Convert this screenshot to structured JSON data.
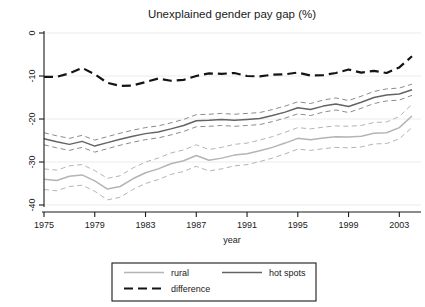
{
  "chart_data": {
    "type": "line",
    "title": "Unexplained gender pay gap (%)",
    "xlabel": "year",
    "ylabel": "",
    "xlim": [
      1975,
      2004
    ],
    "ylim": [
      -40,
      0
    ],
    "xticks": [
      1975,
      1979,
      1983,
      1987,
      1991,
      1995,
      1999,
      2003
    ],
    "yticks": [
      0,
      -10,
      -20,
      -30,
      -40
    ],
    "xtick_labels": [
      "1975",
      "1979",
      "1983",
      "1987",
      "1991",
      "1995",
      "1999",
      "2003"
    ],
    "ytick_labels": [
      "0",
      "-10",
      "-20",
      "-30",
      "-40"
    ],
    "grid": true,
    "legend_position": "bottom",
    "x": [
      1975,
      1976,
      1977,
      1978,
      1979,
      1980,
      1981,
      1982,
      1983,
      1984,
      1985,
      1986,
      1987,
      1988,
      1989,
      1990,
      1991,
      1992,
      1993,
      1994,
      1995,
      1996,
      1997,
      1998,
      1999,
      2000,
      2001,
      2002,
      2003,
      2004
    ],
    "series": [
      {
        "name": "rural",
        "color": "#b4b4b4",
        "style": "solid",
        "values": [
          -34.0,
          -34.3,
          -33.3,
          -33.0,
          -34.4,
          -36.3,
          -35.7,
          -33.9,
          -32.5,
          -31.6,
          -30.4,
          -29.7,
          -28.5,
          -29.6,
          -29.1,
          -28.4,
          -28.1,
          -27.4,
          -26.6,
          -25.6,
          -24.5,
          -24.8,
          -24.4,
          -24.1,
          -24.2,
          -24.0,
          -23.3,
          -23.2,
          -22.0,
          -19.3
        ]
      },
      {
        "name": "rural_ci_upper",
        "color": "#b4b4b4",
        "style": "dashed",
        "values": [
          -31.6,
          -31.9,
          -30.9,
          -30.6,
          -32.0,
          -33.8,
          -33.2,
          -31.4,
          -30.0,
          -29.1,
          -27.9,
          -27.2,
          -26.0,
          -27.1,
          -26.6,
          -25.9,
          -25.6,
          -24.9,
          -24.1,
          -23.1,
          -22.0,
          -22.3,
          -21.9,
          -21.6,
          -21.7,
          -21.5,
          -20.8,
          -20.7,
          -19.4,
          -16.6
        ]
      },
      {
        "name": "rural_ci_lower",
        "color": "#b4b4b4",
        "style": "dashed",
        "values": [
          -36.4,
          -36.7,
          -35.7,
          -35.4,
          -36.8,
          -38.8,
          -38.2,
          -36.4,
          -35.0,
          -34.1,
          -32.9,
          -32.2,
          -31.0,
          -32.1,
          -31.6,
          -30.9,
          -30.6,
          -29.9,
          -29.1,
          -28.1,
          -27.0,
          -27.3,
          -26.9,
          -26.6,
          -26.7,
          -26.5,
          -25.8,
          -25.7,
          -24.6,
          -22.0
        ]
      },
      {
        "name": "hot spots",
        "color": "#646464",
        "style": "solid",
        "values": [
          -24.6,
          -25.3,
          -25.9,
          -25.2,
          -26.3,
          -25.5,
          -24.7,
          -24.0,
          -23.4,
          -23.0,
          -22.3,
          -21.5,
          -20.4,
          -20.3,
          -20.1,
          -20.3,
          -20.1,
          -19.9,
          -19.2,
          -18.4,
          -17.4,
          -17.8,
          -17.0,
          -16.5,
          -17.1,
          -16.1,
          -15.0,
          -14.4,
          -14.2,
          -13.2
        ]
      },
      {
        "name": "hotspots_ci_upper",
        "color": "#8c8c8c",
        "style": "dashed",
        "values": [
          -23.2,
          -23.9,
          -24.5,
          -23.8,
          -24.9,
          -24.1,
          -23.3,
          -22.6,
          -22.0,
          -21.6,
          -20.9,
          -20.1,
          -19.0,
          -18.9,
          -18.7,
          -18.9,
          -18.7,
          -18.5,
          -17.8,
          -17.0,
          -16.0,
          -16.4,
          -15.6,
          -15.1,
          -15.7,
          -14.7,
          -13.6,
          -13.0,
          -12.8,
          -11.9
        ]
      },
      {
        "name": "hotspots_ci_lower",
        "color": "#8c8c8c",
        "style": "dashed",
        "values": [
          -26.0,
          -26.7,
          -27.3,
          -26.6,
          -27.7,
          -26.9,
          -26.1,
          -25.4,
          -24.8,
          -24.4,
          -23.7,
          -22.9,
          -21.8,
          -21.7,
          -21.5,
          -21.7,
          -21.5,
          -21.3,
          -20.6,
          -19.8,
          -18.8,
          -19.2,
          -18.4,
          -17.9,
          -18.5,
          -17.5,
          -16.4,
          -15.8,
          -15.6,
          -14.5
        ]
      },
      {
        "name": "difference",
        "color": "#141414",
        "style": "dashed",
        "values": [
          -10.2,
          -10.2,
          -9.4,
          -8.1,
          -9.6,
          -11.6,
          -12.3,
          -12.2,
          -11.4,
          -10.6,
          -11.1,
          -10.9,
          -10.0,
          -9.4,
          -9.5,
          -9.3,
          -10.0,
          -10.1,
          -9.7,
          -9.6,
          -9.2,
          -9.9,
          -9.8,
          -9.3,
          -8.5,
          -9.2,
          -8.8,
          -9.3,
          -8.0,
          -5.4
        ]
      }
    ],
    "legend_entries": [
      {
        "label": "rural",
        "color": "#b4b4b4",
        "style": "solid"
      },
      {
        "label": "hot spots",
        "color": "#646464",
        "style": "solid"
      },
      {
        "label": "difference",
        "color": "#141414",
        "style": "dashed"
      }
    ]
  }
}
